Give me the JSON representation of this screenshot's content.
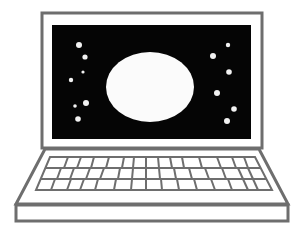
{
  "illustration": {
    "subject": "laptop",
    "screen_scene": "moon-and-stars",
    "colors": {
      "outline": "#6e6e6e",
      "screen": "#050505",
      "moon": "#fbfbfb",
      "stars": "#f2f2f2",
      "background": "#ffffff"
    },
    "keyboard": {
      "rows": 3,
      "keys_per_row": 15
    },
    "stars": {
      "left": 7,
      "right": 7
    }
  }
}
